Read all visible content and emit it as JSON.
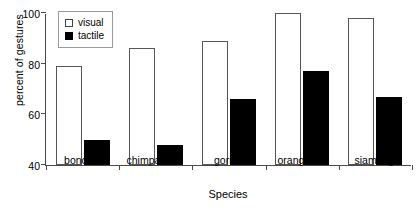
{
  "chart_data": {
    "type": "bar",
    "title": "",
    "xlabel": "Species",
    "ylabel": "percent of gestures",
    "categories": [
      "bonobo",
      "chimpanzee",
      "gorilla",
      "orangutan",
      "siamang"
    ],
    "series": [
      {
        "name": "visual",
        "color": "#ffffff",
        "values": [
          79,
          86,
          89,
          100,
          98
        ]
      },
      {
        "name": "tactile",
        "color": "#000000",
        "values": [
          50,
          48,
          66,
          77,
          67
        ]
      }
    ],
    "ylim": [
      40,
      100
    ],
    "yticks": [
      40,
      60,
      80,
      100
    ],
    "ytick_labels": [
      "40",
      "60",
      "80",
      "100"
    ],
    "grid": false,
    "legend_position": "top-left",
    "legend_entries": [
      "visual",
      "tactile"
    ]
  }
}
